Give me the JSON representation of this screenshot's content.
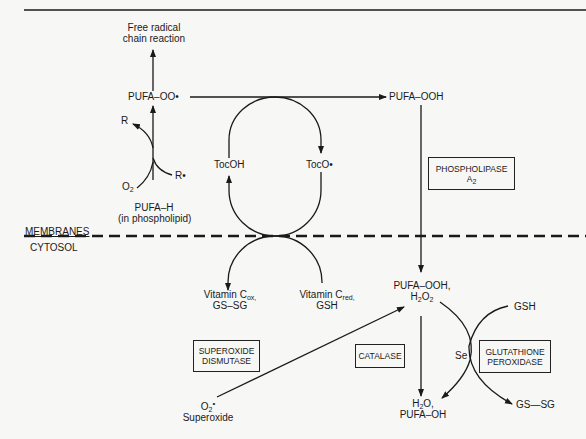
{
  "diagram": {
    "regions": {
      "upper": "MEMBRANES",
      "lower": "CYTOSOL"
    },
    "nodes": {
      "free_radical": [
        "Free radical",
        "chain reaction"
      ],
      "pufa_oo": "PUFA–OO•",
      "pufa_ooh": "PUFA–OOH",
      "r_top": "R",
      "r_radical": "R•",
      "o2": "O",
      "o2_sub": "2",
      "pufa_h": "PUFA–H",
      "pufa_h_note": "(in phospholipid)",
      "tocoh": "TocOH",
      "toco": "TocO•",
      "vitc_ox": "Vitamin C",
      "vitc_ox_sub": "ox,",
      "gssg_left": "GS–SG",
      "vitc_red": "Vitamin C",
      "vitc_red_sub": "red,",
      "gsh_left": "GSH",
      "pufa_ooh_h2o2": "PUFA–OOH,",
      "h2o2_h": "H",
      "h2o2_sub1": "2",
      "h2o2_o": "O",
      "h2o2_sub2": "2",
      "gsh_right": "GSH",
      "se": "Se",
      "gssg_right": "GS—SG",
      "h2o_h": "H",
      "h2o_sub": "2",
      "h2o_o": "O,",
      "pufa_oh": "PUFA–OH",
      "superoxide_symbol": "O",
      "superoxide_sup": "•",
      "superoxide_sub": "2",
      "superoxide": "Superoxide"
    },
    "enzymes": {
      "phospholipase": [
        "PHOSPHOLIPASE",
        "A"
      ],
      "phospholipase_sub": "2",
      "sod": [
        "SUPEROXIDE",
        "DISMUTASE"
      ],
      "catalase": "CATALASE",
      "gpx": [
        "GLUTATHIONE",
        "PEROXIDASE"
      ]
    },
    "colors": {
      "ink": "#1a1a1a",
      "background": "#f7f7f5"
    }
  }
}
